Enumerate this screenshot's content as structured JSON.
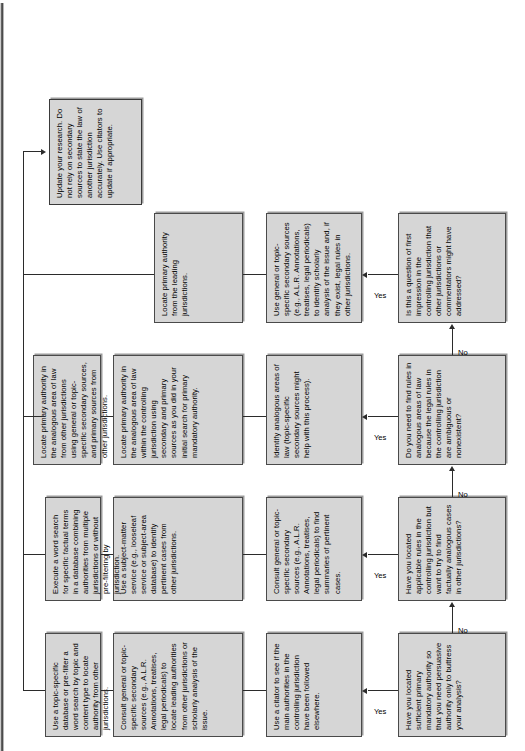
{
  "diagram": {
    "orientation": "rotated-90-ccw",
    "edge_labels": {
      "yes": "Yes",
      "no": "No"
    },
    "colors": {
      "node_fill": "#d6d6d6",
      "node_border": "#4a4a4a",
      "line": "#2b2b2b",
      "page": "#ffffff"
    },
    "decisions": [
      {
        "id": "d1",
        "text": "Have you located sufficient primary mandatory authority so that you need persuasive authority only to buttress your analysis?"
      },
      {
        "id": "d2",
        "text": "Have you located applicable rules in the controlling jurisdiction but want to try to find factually analogous cases in other jurisdictions?"
      },
      {
        "id": "d3",
        "text": "Do you need to find rules in analogous areas of law because the legal rules in the controlling jurisdiction are ambiguous or nonexistent?"
      },
      {
        "id": "d4",
        "text": "Is this a question of first impression in the controlling jurisdiction that other jurisdictions or commentators might have addressed?"
      }
    ],
    "steps_col1": [
      {
        "id": "s1a",
        "text": "Use a citator to see if the main authorities in the controlling jurisdiction have been followed elsewhere."
      },
      {
        "id": "s2a",
        "text": "Consult general or topic-specific secondary sources (e.g., A.L.R. Annotations, treatises, legal periodicals) to find summaries of pertinent cases."
      },
      {
        "id": "s3a",
        "text": "Identify analogous areas of law (topic-specific secondary sources might help with this process)."
      },
      {
        "id": "s4a",
        "text": "Use general or topic-specific secondary sources (e.g., A.L.R. Annotations, treatises, legal periodicals) to identify scholarly analysis of the issue and, if they exist, legal rules in other jurisdictions."
      }
    ],
    "steps_col2": [
      {
        "id": "s1b",
        "text": "Consult general or topic-specific secondary sources (e.g., A.L.R. Annotations, treatises, legal periodicals) to locate leading authorities from other jurisdictions or scholarly analysis of the issue."
      },
      {
        "id": "s2b",
        "text": "Use a subject-matter service (e.g., looseleaf service or subject-area database) to identify pertinent cases from other jurisdictions."
      },
      {
        "id": "s3b",
        "text": "Locate primary authority in the analogous area of law within the controlling jurisdiction using secondary and primary sources as you did in your initial search for primary mandatory authority."
      },
      {
        "id": "s4b",
        "text": "Locate primary authority from the leading jurisdictions."
      }
    ],
    "steps_col3": [
      {
        "id": "s1c",
        "text": "Use a topic-specific database or pre-filter a word search by topic and content type to locate authority from other jurisdictions."
      },
      {
        "id": "s2c",
        "text": "Execute a word search for specific factual terms in a database combining authorities from multiple jurisdictions or without pre-filtering by jurisdiction."
      },
      {
        "id": "s3c",
        "text": "Locate primary authority in the analogous area of law from other jurisdictions using general or topic-specific secondary sources, and primary sources from other jurisdictions."
      }
    ],
    "final": {
      "id": "final",
      "text": "Update your research. Do not rely on secondary sources to state the law of another jurisdiction accurately. Use citators to update if appropriate."
    }
  }
}
